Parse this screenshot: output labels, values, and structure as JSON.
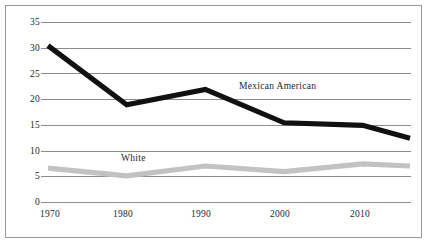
{
  "chart_data": {
    "type": "line",
    "title": "",
    "subtitle": "",
    "xlabel": "",
    "ylabel": "",
    "xlim": [
      1970,
      2016
    ],
    "ylim": [
      0,
      35
    ],
    "grid": true,
    "legend_position": "inline-annotation",
    "x_ticks": [
      "1970",
      "1980",
      "1990",
      "2000",
      "2010"
    ],
    "x_tick_values": [
      1970,
      1980,
      1990,
      2000,
      2010
    ],
    "y_ticks": [
      "0",
      "5",
      "10",
      "15",
      "20",
      "25",
      "30",
      "35"
    ],
    "y_tick_values": [
      0,
      5,
      10,
      15,
      20,
      25,
      30,
      35
    ],
    "x": [
      1970,
      1980,
      1990,
      2000,
      2010,
      2016
    ],
    "series": [
      {
        "name": "Mexican American",
        "color": "#111111",
        "values": [
          30.5,
          19.0,
          22.0,
          15.5,
          15.0,
          12.5
        ],
        "label_x": 1994.5,
        "label_y": 24.5
      },
      {
        "name": "White",
        "color": "#c2c2c2",
        "values": [
          6.7,
          5.2,
          7.1,
          6.0,
          7.5,
          7.1
        ],
        "label_x": 1980.3,
        "label_y": 9.4
      }
    ]
  },
  "axes": {
    "y_tick_labels": [
      "35",
      "30",
      "25",
      "20",
      "15",
      "10",
      "5",
      "0"
    ],
    "x_tick_labels": [
      "1970",
      "1980",
      "1990",
      "2000",
      "2010"
    ]
  },
  "annotations": {
    "mexican_american": "Mexican American",
    "white": "White"
  },
  "colors": {
    "dark_series": "#111111",
    "light_series": "#c2c2c2",
    "gridline": "#808080",
    "frame": "#9a9a9a",
    "text": "#231f20",
    "background": "#ffffff"
  }
}
